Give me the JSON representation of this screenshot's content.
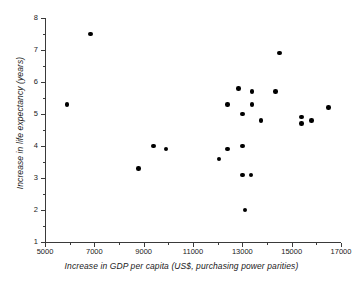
{
  "chart_data": {
    "type": "scatter",
    "title": "",
    "xlabel": "Increase in GDP per capita (US$, purchasing power parities)",
    "ylabel": "Increase in life expectancy (years)",
    "xlim": [
      5000,
      17000
    ],
    "ylim": [
      1,
      8
    ],
    "xticks": [
      5000,
      7000,
      9000,
      11000,
      13000,
      15000,
      17000
    ],
    "xtick_labels": [
      "5000",
      "7000",
      "9000",
      "11000",
      "13000",
      "15000",
      "17000"
    ],
    "xminor_ticks": [
      6000,
      8000,
      10000,
      12000,
      14000,
      16000
    ],
    "yticks": [
      1,
      2,
      3,
      4,
      5,
      6,
      7,
      8
    ],
    "ytick_labels": [
      "1",
      "2",
      "3",
      "4",
      "5",
      "6",
      "7",
      "8"
    ],
    "yminor_ticks": [
      1.5,
      2.5,
      3.5,
      4.5,
      5.5,
      6.5,
      7.5
    ],
    "grid": false,
    "legend": false,
    "marker": "filled-circle",
    "marker_color": "#000000",
    "points": [
      {
        "x": 5900,
        "y": 5.3
      },
      {
        "x": 6850,
        "y": 7.5
      },
      {
        "x": 8800,
        "y": 3.3
      },
      {
        "x": 9400,
        "y": 4.0
      },
      {
        "x": 9900,
        "y": 3.9
      },
      {
        "x": 12050,
        "y": 3.6
      },
      {
        "x": 12400,
        "y": 5.3
      },
      {
        "x": 12400,
        "y": 3.9
      },
      {
        "x": 12850,
        "y": 5.8
      },
      {
        "x": 13000,
        "y": 5.0
      },
      {
        "x": 13000,
        "y": 4.0
      },
      {
        "x": 13000,
        "y": 3.1
      },
      {
        "x": 13100,
        "y": 2.0
      },
      {
        "x": 13350,
        "y": 3.1
      },
      {
        "x": 13400,
        "y": 5.7
      },
      {
        "x": 13400,
        "y": 5.3
      },
      {
        "x": 13750,
        "y": 4.8
      },
      {
        "x": 14500,
        "y": 6.9
      },
      {
        "x": 14350,
        "y": 5.7
      },
      {
        "x": 15400,
        "y": 4.9
      },
      {
        "x": 15400,
        "y": 4.7
      },
      {
        "x": 15800,
        "y": 4.8
      },
      {
        "x": 16500,
        "y": 5.2
      }
    ]
  }
}
